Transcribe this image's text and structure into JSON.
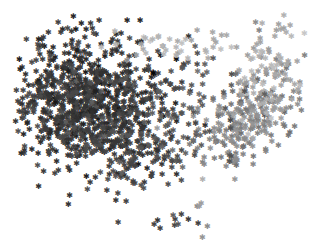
{
  "chart_data": {
    "type": "scatter",
    "title": "",
    "xlabel": "",
    "ylabel": "",
    "grid": false,
    "legend": null,
    "axes_visible": false,
    "marker": "star",
    "colormap": "grayscale (dark = cluster A, light = cluster B)",
    "clusters": [
      {
        "name": "dense-dark-cluster",
        "center": [
          85,
          100
        ],
        "spread": [
          38,
          32
        ],
        "count": 900,
        "color": "#3a3a3a"
      },
      {
        "name": "dark-tail",
        "center": [
          130,
          150
        ],
        "spread": [
          25,
          18
        ],
        "count": 140,
        "color": "#454545"
      },
      {
        "name": "mid-gray-cluster-east",
        "center": [
          250,
          120
        ],
        "spread": [
          28,
          22
        ],
        "count": 220,
        "color": "#8a8a8a"
      },
      {
        "name": "light-gray-arc-northeast",
        "center": [
          270,
          70
        ],
        "spread": [
          18,
          26
        ],
        "count": 90,
        "color": "#a8a8a8"
      },
      {
        "name": "mid-gray-band-north",
        "center": [
          175,
          45
        ],
        "spread": [
          30,
          8
        ],
        "count": 40,
        "color": "#b5b5b5"
      },
      {
        "name": "scattered-center",
        "center": [
          190,
          110
        ],
        "spread": [
          30,
          25
        ],
        "count": 80,
        "color": "#5a5a5a"
      },
      {
        "name": "southern-outliers-dark",
        "center": [
          178,
          215
        ],
        "spread": [
          8,
          12
        ],
        "count": 9,
        "color": "#3f3f3f"
      },
      {
        "name": "southern-outliers-light",
        "center": [
          202,
          210
        ],
        "spread": [
          3,
          14
        ],
        "count": 7,
        "color": "#9a9a9a"
      }
    ],
    "outliers": [
      {
        "x": 58,
        "y": 22,
        "color": "#444444"
      },
      {
        "x": 22,
        "y": 112,
        "color": "#444444"
      },
      {
        "x": 118,
        "y": 222,
        "color": "#444444"
      },
      {
        "x": 126,
        "y": 201,
        "color": "#444444"
      },
      {
        "x": 160,
        "y": 228,
        "color": "#444444"
      },
      {
        "x": 236,
        "y": 158,
        "color": "#8c8c8c"
      },
      {
        "x": 237,
        "y": 160,
        "color": "#8c8c8c"
      },
      {
        "x": 290,
        "y": 25,
        "color": "#aaaaaa"
      }
    ],
    "xlim": [
      0,
      312
    ],
    "ylim": [
      0,
      251
    ]
  }
}
